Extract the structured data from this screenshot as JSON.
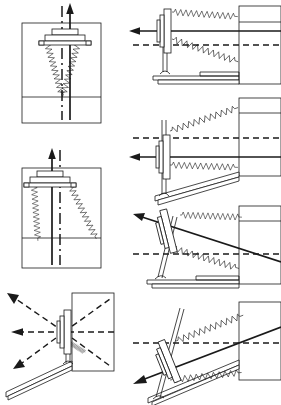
{
  "figure": {
    "title": "Spring-loaded tilting launcher mechanism",
    "view_count": 7,
    "background_color": "#ffffff",
    "line_color": "#1a1a1a",
    "panels": [
      {
        "id": "panel-front-vertical",
        "name": "front-view-vertical",
        "column": "left",
        "row": 1,
        "view": "front",
        "elevation_label": "0",
        "carriage_offset": "centered",
        "axis_arrow": "up",
        "axis_arrow_style": "solid",
        "centerline_style": "dash-dot",
        "spring_count": 2,
        "spring_orientation": "symmetric-splayed"
      },
      {
        "id": "panel-side-horizontal",
        "name": "side-view-horizontal",
        "column": "right",
        "row": 1,
        "view": "side",
        "elevation_label": "0",
        "axis_arrow": "left",
        "axis_arrow_style": "solid",
        "centerline_style": "dash",
        "spring_count": 2,
        "base_rail": "level",
        "mast_angle_deg": 0
      },
      {
        "id": "panel-front-offset",
        "name": "front-view-offset",
        "column": "left",
        "row": 2,
        "view": "front",
        "elevation_label": "0",
        "carriage_offset": "left-shifted",
        "axis_arrow": "up",
        "axis_arrow_style": "solid",
        "centerline_style": "dash-dot",
        "spring_count": 2,
        "spring_orientation": "asymmetric"
      },
      {
        "id": "panel-side-low-tilt",
        "name": "side-view-low-tilt",
        "column": "right",
        "row": 2,
        "view": "side",
        "elevation_label": "low",
        "axis_arrow": "left",
        "axis_arrow_style": "solid",
        "centerline_style": "dash",
        "spring_count": 2,
        "base_rail": "inclined",
        "mast_angle_deg": 5
      },
      {
        "id": "panel-side-mid-tilt",
        "name": "side-view-mid-tilt",
        "column": "right",
        "row": 3,
        "view": "side",
        "elevation_label": "mid",
        "axis_arrow": "upper-left",
        "axis_arrow_style": "solid",
        "centerline_style": "dash",
        "spring_count": 2,
        "base_rail": "level",
        "mast_angle_deg": 14
      },
      {
        "id": "panel-front-traverse",
        "name": "front-view-traverse-fan",
        "column": "left",
        "row": 3,
        "view": "front",
        "elevation_label": "traverse",
        "axis_arrow": "left",
        "axis_arrow_style": "dashed",
        "centerline_style": "dash",
        "fan_ray_count": 4,
        "fan_ray_style": "dashed",
        "fan_arrow_directions": [
          "upper-left",
          "left",
          "lower-left",
          "upper-right-diagonal"
        ],
        "base_rail": "inclined"
      },
      {
        "id": "panel-side-high-tilt",
        "name": "side-view-high-tilt",
        "column": "right",
        "row": 4,
        "view": "side",
        "elevation_label": "high",
        "axis_arrow": "lower-left",
        "axis_arrow_style": "solid",
        "centerline_style": "dash",
        "spring_count": 2,
        "base_rail": "steeply-inclined",
        "mast_angle_deg": 22
      }
    ],
    "components": [
      {
        "key": "carriage",
        "label": "carriage-plate"
      },
      {
        "key": "spring",
        "label": "helical-tension-spring"
      },
      {
        "key": "mast",
        "label": "guide-mast"
      },
      {
        "key": "base_rail",
        "label": "base-rail"
      },
      {
        "key": "wall_block",
        "label": "frame-block"
      },
      {
        "key": "pivot",
        "label": "pivot-hub"
      },
      {
        "key": "axis_arrow",
        "label": "motion-axis-arrow"
      },
      {
        "key": "centerline",
        "label": "reference-centerline"
      }
    ]
  }
}
